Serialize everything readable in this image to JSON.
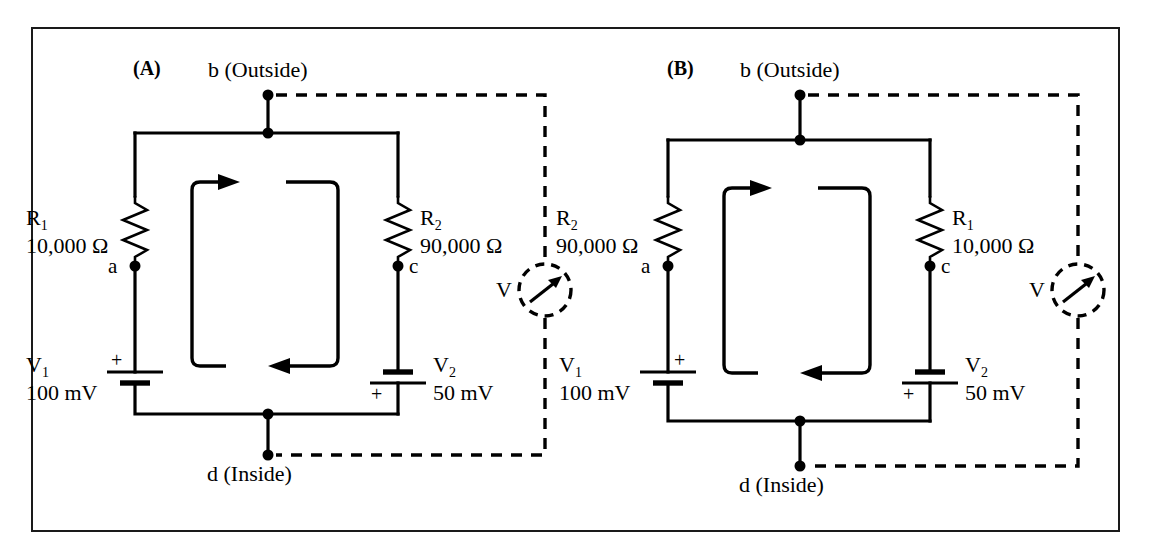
{
  "figure": {
    "border_color": "#1a1a1a",
    "background": "#ffffff",
    "wire_color": "#000000"
  },
  "panels": [
    {
      "tag": "(A)",
      "top_node": {
        "label": "b (Outside)",
        "name": "b"
      },
      "bottom_node": {
        "label": "d (Inside)",
        "name": "d"
      },
      "left_branch": {
        "resistor_name": "R",
        "resistor_sub": "1",
        "resistor_value": "10,000 Ω",
        "node_label": "a",
        "battery_name": "V",
        "battery_sub": "1",
        "battery_value": "100 mV",
        "battery_polarity": "+",
        "polarity_position": "top"
      },
      "right_branch": {
        "resistor_name": "R",
        "resistor_sub": "2",
        "resistor_value": "90,000 Ω",
        "node_label": "c",
        "battery_name": "V",
        "battery_sub": "2",
        "battery_value": "50 mV",
        "battery_polarity": "+",
        "polarity_position": "bottom"
      },
      "current_loop": {
        "direction": "clockwise",
        "top_arrow": "right",
        "bottom_arrow": "left"
      },
      "meter": {
        "label": "V",
        "type": "voltmeter",
        "style": "dashed"
      }
    },
    {
      "tag": "(B)",
      "top_node": {
        "label": "b (Outside)",
        "name": "b"
      },
      "bottom_node": {
        "label": "d (Inside)",
        "name": "d"
      },
      "left_branch": {
        "resistor_name": "R",
        "resistor_sub": "2",
        "resistor_value": "90,000 Ω",
        "node_label": "a",
        "battery_name": "V",
        "battery_sub": "1",
        "battery_value": "100 mV",
        "battery_polarity": "+",
        "polarity_position": "top"
      },
      "right_branch": {
        "resistor_name": "R",
        "resistor_sub": "1",
        "resistor_value": "10,000 Ω",
        "node_label": "c",
        "battery_name": "V",
        "battery_sub": "2",
        "battery_value": "50 mV",
        "battery_polarity": "+",
        "polarity_position": "bottom"
      },
      "current_loop": {
        "direction": "clockwise",
        "top_arrow": "right",
        "bottom_arrow": "left"
      },
      "meter": {
        "label": "V",
        "type": "voltmeter",
        "style": "dashed"
      }
    }
  ]
}
